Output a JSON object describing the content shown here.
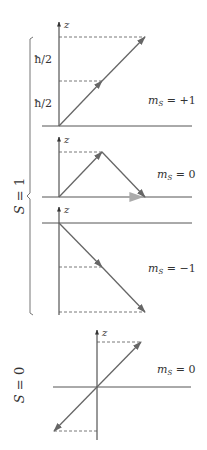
{
  "figure": {
    "axis_label": "z",
    "hbar_label": "ħ/2",
    "colors": {
      "axis": "#555555",
      "arrow": "#666666",
      "sum_arrow": "#aaaaaa",
      "dash": "#555555"
    },
    "groups": [
      {
        "label": "S = 1",
        "label_var": "S",
        "label_eq": " = 1"
      },
      {
        "label": "S = 0",
        "label_var": "S",
        "label_eq": " = 0"
      }
    ],
    "panels": [
      {
        "name": "triplet-plus",
        "ms_var": "m",
        "ms_sub": "S",
        "ms_value": " = +1",
        "tick_labels": [
          "ħ/2",
          "ħ/2"
        ]
      },
      {
        "name": "triplet-zero",
        "ms_var": "m",
        "ms_sub": "S",
        "ms_value": " = 0"
      },
      {
        "name": "triplet-minus",
        "ms_var": "m",
        "ms_sub": "S",
        "ms_value": " = −1"
      },
      {
        "name": "singlet",
        "ms_var": "m",
        "ms_sub": "S",
        "ms_value": " = 0"
      }
    ]
  }
}
